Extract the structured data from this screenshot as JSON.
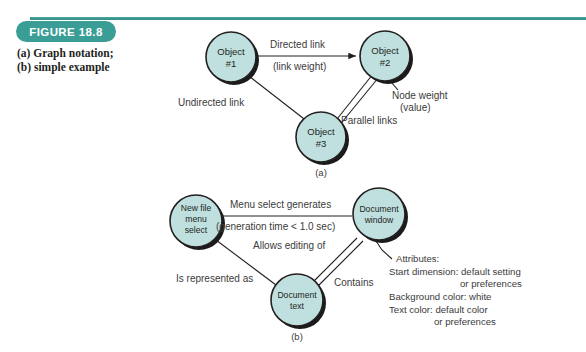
{
  "figure": {
    "badge": "FIGURE 18.8",
    "caption": "(a) Graph notation; (b) simple example",
    "badge_color": "#3a9e96",
    "node_fill": "#bfe0de",
    "node_stroke": "#231f20"
  },
  "diagram_a": {
    "part_label": "(a)",
    "nodes": [
      {
        "id": "object1",
        "line1": "Object",
        "line2": "#1"
      },
      {
        "id": "object2",
        "line1": "Object",
        "line2": "#2"
      },
      {
        "id": "object3",
        "line1": "Object",
        "line2": "#3"
      }
    ],
    "edge_labels": {
      "directed": "Directed link",
      "link_weight": "(link weight)",
      "undirected": "Undirected link",
      "parallel": "Parallel links"
    },
    "annotations": {
      "node_weight_line1": "Node weight",
      "node_weight_line2": "(value)"
    }
  },
  "diagram_b": {
    "part_label": "(b)",
    "nodes": [
      {
        "id": "new-file-menu-select",
        "line1": "New file",
        "line2": "menu",
        "line3": "select"
      },
      {
        "id": "document-window",
        "line1": "Document",
        "line2": "window"
      },
      {
        "id": "document-text",
        "line1": "Document",
        "line2": "text"
      }
    ],
    "edge_labels": {
      "menu_select": "Menu select generates",
      "generation_time": "(generation time < 1.0 sec)",
      "allows_editing": "Allows editing of",
      "is_represented": "Is represented as",
      "contains": "Contains"
    },
    "attributes": {
      "heading": "Attributes:",
      "line1": "Start dimension: default setting",
      "line2": "or preferences",
      "line3": "Background color: white",
      "line4": "Text color: default color",
      "line5": "or preferences"
    }
  }
}
